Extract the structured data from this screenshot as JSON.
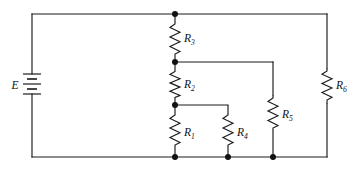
{
  "figure": {
    "kind": "schematic-circuit-diagram",
    "background_color": "#ffffff",
    "line_color": "#1b1b1b",
    "node_color": "#111111",
    "width": 353,
    "height": 169
  },
  "source": {
    "id": "E",
    "label": "E",
    "symbol": "battery-multicell",
    "orientation": "vertical",
    "position": {
      "x": 32,
      "y": 85
    },
    "label_position": {
      "x": 15,
      "y": 89
    },
    "plates": [
      {
        "kind": "long",
        "half_width": 9,
        "y": 74
      },
      {
        "kind": "short",
        "half_width": 5,
        "y": 79
      },
      {
        "kind": "long",
        "half_width": 9,
        "y": 84
      },
      {
        "kind": "short",
        "half_width": 5,
        "y": 89
      },
      {
        "kind": "long",
        "half_width": 9,
        "y": 94
      }
    ]
  },
  "resistors": [
    {
      "id": "R1",
      "label": "R",
      "subscript": "1",
      "orientation": "vertical",
      "x": 175,
      "y_start": 112,
      "y_end": 150,
      "label_x": 184,
      "label_y": 136
    },
    {
      "id": "R2",
      "label": "R",
      "subscript": "2",
      "orientation": "vertical",
      "x": 175,
      "y_start": 69,
      "y_end": 99,
      "label_x": 184,
      "label_y": 88
    },
    {
      "id": "R3",
      "label": "R",
      "subscript": "3",
      "orientation": "vertical",
      "x": 175,
      "y_start": 21,
      "y_end": 55,
      "label_x": 184,
      "label_y": 42
    },
    {
      "id": "R4",
      "label": "R",
      "subscript": "4",
      "orientation": "vertical",
      "x": 228,
      "y_start": 112,
      "y_end": 150,
      "label_x": 237,
      "label_y": 136
    },
    {
      "id": "R5",
      "label": "R",
      "subscript": "5",
      "orientation": "vertical",
      "x": 273,
      "y_start": 95,
      "y_end": 133,
      "label_x": 282,
      "label_y": 118
    },
    {
      "id": "R6",
      "label": "R",
      "subscript": "6",
      "orientation": "vertical",
      "x": 327,
      "y_start": 68,
      "y_end": 104,
      "label_x": 336,
      "label_y": 89
    }
  ],
  "rails": {
    "top_y": 14,
    "bottom_y": 157,
    "left_x": 32,
    "right_x": 327
  },
  "junction_nodes": [
    {
      "name": "top-center-node",
      "x": 175,
      "y": 14
    },
    {
      "name": "r3-r2-node",
      "x": 175,
      "y": 62
    },
    {
      "name": "r2-r1-node",
      "x": 175,
      "y": 105
    },
    {
      "name": "r1-bottom-node",
      "x": 175,
      "y": 157
    },
    {
      "name": "r4-bottom-node",
      "x": 228,
      "y": 157
    },
    {
      "name": "r5-bottom-node",
      "x": 273,
      "y": 157
    }
  ],
  "connections": [
    {
      "name": "top-rail",
      "from": [
        32,
        14
      ],
      "to": [
        327,
        14
      ]
    },
    {
      "name": "bottom-rail",
      "from": [
        32,
        157
      ],
      "to": [
        327,
        157
      ]
    },
    {
      "name": "left-rail-upper",
      "from": [
        32,
        14
      ],
      "to": [
        32,
        74
      ]
    },
    {
      "name": "left-rail-lower",
      "from": [
        32,
        94
      ],
      "to": [
        32,
        157
      ]
    },
    {
      "name": "right-rail-upper",
      "from": [
        327,
        14
      ],
      "to": [
        327,
        68
      ]
    },
    {
      "name": "right-rail-lower",
      "from": [
        327,
        104
      ],
      "to": [
        327,
        157
      ]
    },
    {
      "name": "r3-to-r2-link",
      "from": [
        175,
        55
      ],
      "to": [
        175,
        69
      ]
    },
    {
      "name": "r2-to-r1-link",
      "from": [
        175,
        99
      ],
      "to": [
        175,
        112
      ]
    },
    {
      "name": "node-a-to-r5-branch",
      "from": [
        175,
        62
      ],
      "to": [
        273,
        62
      ]
    },
    {
      "name": "r5-branch-drop",
      "from": [
        273,
        62
      ],
      "to": [
        273,
        95
      ]
    },
    {
      "name": "r5-to-bottom",
      "from": [
        273,
        133
      ],
      "to": [
        273,
        157
      ]
    },
    {
      "name": "node-b-to-r4-branch",
      "from": [
        175,
        105
      ],
      "to": [
        228,
        105
      ]
    },
    {
      "name": "r4-branch-drop",
      "from": [
        228,
        105
      ],
      "to": [
        228,
        112
      ]
    },
    {
      "name": "r4-to-bottom",
      "from": [
        228,
        150
      ],
      "to": [
        228,
        157
      ]
    },
    {
      "name": "r1-to-bottom",
      "from": [
        175,
        150
      ],
      "to": [
        175,
        157
      ]
    },
    {
      "name": "r3-to-top",
      "from": [
        175,
        14
      ],
      "to": [
        175,
        21
      ]
    }
  ]
}
